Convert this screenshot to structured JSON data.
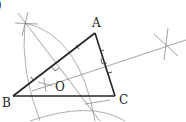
{
  "figure": {
    "partial_label": ")",
    "vertices": {
      "A": {
        "label": "A",
        "x": 95,
        "y": 33
      },
      "B": {
        "label": "B",
        "x": 13,
        "y": 96
      },
      "C": {
        "label": "C",
        "x": 115,
        "y": 96
      }
    },
    "center": {
      "label": "O"
    },
    "colors": {
      "triangle": "#222222",
      "construction": "#999999"
    }
  }
}
